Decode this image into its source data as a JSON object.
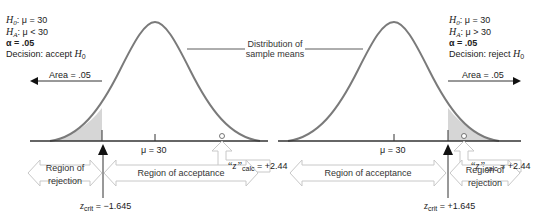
{
  "left_panel": {
    "h0_label": "H",
    "h0_sub": "0",
    "h0_rest": ": μ = 30",
    "ha_label": "H",
    "ha_sub": "A",
    "ha_rest": ": μ < 30",
    "alpha": "α = .05",
    "decision_prefix": "Decision: accept ",
    "decision_h": "H",
    "decision_sub": "0",
    "area_label": "Area = .05",
    "mu_label": "μ = 30",
    "z_calc_prefix": "“z”",
    "z_calc_sub": "calc",
    "z_calc_value": " = +2.44",
    "z_crit_z": "z",
    "z_crit_sub": "crit",
    "z_crit_value": " = −1.645",
    "region_rejection_line1": "Region of",
    "region_rejection_line2": "rejection",
    "region_acceptance": "Region of acceptance"
  },
  "right_panel": {
    "h0_label": "H",
    "h0_sub": "0",
    "h0_rest": ": μ = 30",
    "ha_label": "H",
    "ha_sub": "A",
    "ha_rest": ": μ > 30",
    "alpha": "α = .05",
    "decision_prefix": "Decision: reject ",
    "decision_h": "H",
    "decision_sub": "0",
    "area_label": "Area = .05",
    "mu_label": "μ = 30",
    "z_calc_prefix": "“z”",
    "z_calc_sub": "calc",
    "z_calc_value": " = +2.44",
    "z_crit_z": "z",
    "z_crit_sub": "crit",
    "z_crit_value": " = +1.645",
    "region_rejection_line1": "Region of",
    "region_rejection_line2": "rejection",
    "region_acceptance": "Region of acceptance"
  },
  "center": {
    "distribution_line1": "Distribution of",
    "distribution_line2": "sample means"
  },
  "colors": {
    "curve": "#7a7a7a",
    "shade": "#d6d6d6",
    "axis": "#333333",
    "region_arrow_stroke": "#c8c8c8"
  }
}
